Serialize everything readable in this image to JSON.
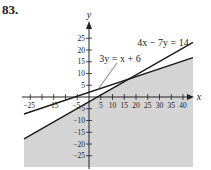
{
  "problem_number": "83.",
  "chart_data": {
    "type": "line",
    "title": "",
    "xlabel": "x",
    "ylabel": "y",
    "xlim": [
      -29,
      44
    ],
    "ylim": [
      -30,
      27
    ],
    "x_ticks": [
      -25,
      -20,
      -15,
      -10,
      -5,
      5,
      10,
      15,
      20,
      25,
      30,
      35,
      40
    ],
    "x_tick_labels": [
      "-25",
      "-15",
      "-5",
      "5",
      "10",
      "15",
      "20",
      "25",
      "30",
      "35",
      "40"
    ],
    "x_labeled_ticks": [
      -25,
      -15,
      -5,
      5,
      10,
      15,
      20,
      25,
      30,
      35,
      40
    ],
    "y_ticks": [
      25,
      20,
      15,
      10,
      5,
      -5,
      -10,
      -15,
      -20,
      -25
    ],
    "y_tick_labels": [
      "25",
      "20",
      "15",
      "10",
      "5",
      "-5",
      "-10",
      "-15",
      "-20",
      "-25"
    ],
    "series": [
      {
        "name": "3y = x + 6",
        "equation": "y = (x + 6)/3",
        "slope": 0.3333,
        "intercept": 2
      },
      {
        "name": "4x − 7y = 14",
        "equation": "y = (4x − 14)/7",
        "slope": 0.5714,
        "intercept": -2
      }
    ],
    "annotations": [
      {
        "text": "4x − 7y = 14",
        "attached_to": "4x − 7y = 14"
      },
      {
        "text": "3y = x + 6",
        "attached_to": "3y = x + 6",
        "leader_line": true
      }
    ],
    "shaded_region": "below both lines (y < (x+6)/3 and y < (4x−14)/7)",
    "intersection": [
      18,
      8
    ],
    "shade_color": "#d4d4d4",
    "line_color": "#1a1a1a",
    "grid": false
  }
}
